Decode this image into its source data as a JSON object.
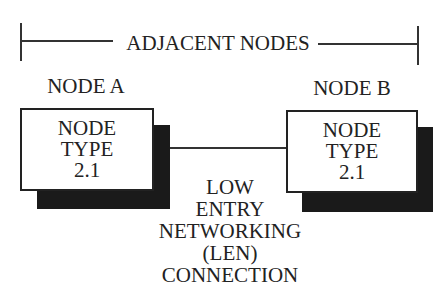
{
  "header": {
    "span_label": "ADJACENT NODES"
  },
  "nodes": [
    {
      "name": "NODE A",
      "box_lines": [
        "NODE",
        "TYPE",
        "2.1"
      ]
    },
    {
      "name": "NODE B",
      "box_lines": [
        "NODE",
        "TYPE",
        "2.1"
      ]
    }
  ],
  "connection": {
    "lines": [
      "LOW",
      "ENTRY",
      "NETWORKING",
      "(LEN)",
      "CONNECTION"
    ]
  },
  "colors": {
    "ink": "#222222",
    "shadow": "#1a1a1a",
    "background": "#ffffff"
  }
}
